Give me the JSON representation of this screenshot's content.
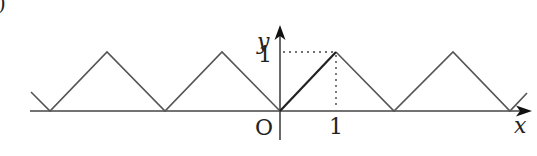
{
  "figure": {
    "corner_mark": ")",
    "axes": {
      "x_label": "x",
      "y_label": "y",
      "origin_label": "O",
      "x_tick_label": "1",
      "y_tick_label": "1"
    },
    "function": "triangle wave, period 2, f(x)=|x| on [-1,1], max 1, min 0",
    "highlighted_segment": "from (0,0) to (1,1) drawn bold"
  }
}
